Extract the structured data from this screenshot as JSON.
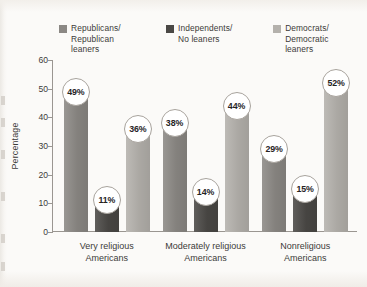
{
  "chart_data": {
    "type": "bar",
    "title": "",
    "subtitle": "",
    "xlabel": "",
    "ylabel": "Percentage",
    "ylim": [
      0,
      60
    ],
    "yticks": [
      0,
      10,
      20,
      30,
      40,
      50,
      60
    ],
    "ytick_labels": [
      "0",
      "10",
      "20",
      "30",
      "40",
      "50",
      "60"
    ],
    "grid": false,
    "legend_position": "top",
    "value_suffix": "%",
    "categories": [
      "Very religious\nAmericans",
      "Moderately religious\nAmericans",
      "Nonreligious\nAmericans"
    ],
    "series": [
      {
        "name": "Republicans/\nRepublican\nleaners",
        "color": "#8b8884",
        "values": [
          49,
          38,
          29
        ],
        "labels": [
          "49%",
          "38%",
          "29%"
        ]
      },
      {
        "name": "Independents/\nNo leaners",
        "color": "#4a4845",
        "values": [
          11,
          14,
          15
        ],
        "labels": [
          "11%",
          "14%",
          "15%"
        ]
      },
      {
        "name": "Democrats/\nDemocratic\nleaners",
        "color": "#b4b1ac",
        "values": [
          36,
          44,
          52
        ],
        "labels": [
          "36%",
          "44%",
          "52%"
        ]
      }
    ]
  }
}
